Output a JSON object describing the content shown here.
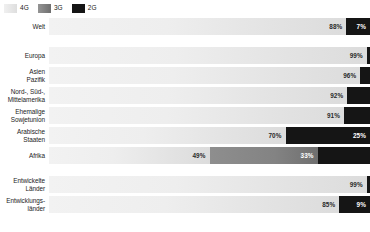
{
  "legend": {
    "items": [
      {
        "label": "4G",
        "color": "#e8e8e8",
        "key": "4g"
      },
      {
        "label": "3G",
        "color": "#7d7d7d",
        "key": "3g"
      },
      {
        "label": "2G",
        "color": "#151515",
        "key": "2g"
      }
    ]
  },
  "chart_data": {
    "type": "bar",
    "orientation": "horizontal",
    "stacked": true,
    "title": "",
    "xlabel": "",
    "ylabel": "",
    "xlim": [
      0,
      100
    ],
    "grid": false,
    "legend_position": "top-left",
    "series": [
      {
        "name": "4G",
        "color": "#e8e8e8"
      },
      {
        "name": "3G",
        "color": "#7d7d7d"
      },
      {
        "name": "2G",
        "color": "#151515"
      }
    ],
    "categories": [
      "Welt",
      "Europa",
      "Asien Pazifik",
      "Nord-, Süd-, Mittelamerika",
      "Ehemalige Sowjetunion",
      "Arabische Staaten",
      "Afrika",
      "Entwickelte Länder",
      "Entwicklungsländer"
    ],
    "rows": [
      {
        "label_lines": [
          "Welt"
        ],
        "segments": [
          {
            "series": "4G",
            "value": 88,
            "label": "88%",
            "show_label": true
          },
          {
            "series": "2G",
            "value": 7,
            "label": "7%",
            "show_label": true
          }
        ]
      },
      {
        "label_lines": [
          "Europa"
        ],
        "segments": [
          {
            "series": "4G",
            "value": 99,
            "label": "99%",
            "show_label": true
          },
          {
            "series": "2G",
            "value": 1,
            "label": "1%",
            "show_label": false
          }
        ]
      },
      {
        "label_lines": [
          "Asien",
          "Pazifik"
        ],
        "segments": [
          {
            "series": "4G",
            "value": 96,
            "label": "96%",
            "show_label": true
          },
          {
            "series": "2G",
            "value": 3,
            "label": "3%",
            "show_label": false
          }
        ]
      },
      {
        "label_lines": [
          "Nord-, Süd-,",
          "Mittelamerika"
        ],
        "segments": [
          {
            "series": "4G",
            "value": 92,
            "label": "92%",
            "show_label": true
          },
          {
            "series": "2G",
            "value": 7,
            "label": "7%",
            "show_label": false
          }
        ]
      },
      {
        "label_lines": [
          "Ehemalige",
          "Sowjetunion"
        ],
        "segments": [
          {
            "series": "4G",
            "value": 91,
            "label": "91%",
            "show_label": true
          },
          {
            "series": "2G",
            "value": 8,
            "label": "8%",
            "show_label": false
          }
        ]
      },
      {
        "label_lines": [
          "Arabische",
          "Staaten"
        ],
        "segments": [
          {
            "series": "4G",
            "value": 70,
            "label": "70%",
            "show_label": true
          },
          {
            "series": "2G",
            "value": 25,
            "label": "25%",
            "show_label": true
          }
        ]
      },
      {
        "label_lines": [
          "Afrika"
        ],
        "segments": [
          {
            "series": "4G",
            "value": 49,
            "label": "49%",
            "show_label": true
          },
          {
            "series": "3G",
            "value": 33,
            "label": "33%",
            "show_label": true
          },
          {
            "series": "2G",
            "value": 16,
            "label": "16%",
            "show_label": false
          }
        ]
      },
      {
        "label_lines": [
          "Entwickelte",
          "Länder"
        ],
        "segments": [
          {
            "series": "4G",
            "value": 99,
            "label": "99%",
            "show_label": true
          },
          {
            "series": "2G",
            "value": 1,
            "label": "1%",
            "show_label": false
          }
        ]
      },
      {
        "label_lines": [
          "Entwicklungs-",
          "länder"
        ],
        "segments": [
          {
            "series": "4G",
            "value": 85,
            "label": "85%",
            "show_label": true
          },
          {
            "series": "2G",
            "value": 9,
            "label": "9%",
            "show_label": true
          }
        ]
      }
    ]
  },
  "layout": {
    "row_height": 17,
    "row_gap": 3,
    "group_gap": 9,
    "group_breaks": [
      1,
      7
    ]
  }
}
